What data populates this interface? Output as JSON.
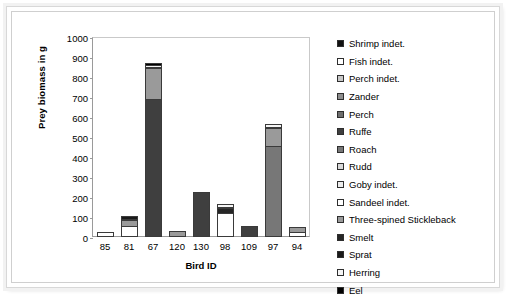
{
  "chart_data": {
    "type": "bar",
    "subtype": "stacked-bar",
    "title": "",
    "xlabel": "Bird ID",
    "ylabel": "Prey biomass in g",
    "categories": [
      "85",
      "81",
      "67",
      "120",
      "130",
      "98",
      "109",
      "97",
      "94"
    ],
    "ylim": [
      0,
      1000
    ],
    "yticks": [
      0,
      100,
      200,
      300,
      400,
      500,
      600,
      700,
      800,
      900,
      1000
    ],
    "grid": false,
    "legend_position": "right",
    "series": [
      {
        "name": "Shrimp indet.",
        "color": "#111111",
        "values": [
          0,
          0,
          0,
          0,
          0,
          0,
          0,
          0,
          0
        ]
      },
      {
        "name": "Fish indet.",
        "color": "#ffffff",
        "values": [
          25,
          55,
          0,
          0,
          0,
          0,
          0,
          0,
          22
        ]
      },
      {
        "name": "Perch indet.",
        "color": "#c8c8c8",
        "values": [
          0,
          0,
          0,
          0,
          0,
          0,
          0,
          0,
          0
        ]
      },
      {
        "name": "Zander",
        "color": "#8e8e8e",
        "values": [
          0,
          0,
          0,
          0,
          0,
          0,
          0,
          0,
          0
        ]
      },
      {
        "name": "Perch",
        "color": "#6e6e6e",
        "values": [
          0,
          0,
          0,
          0,
          0,
          0,
          0,
          0,
          0
        ]
      },
      {
        "name": "Ruffe",
        "color": "#3f3f3f",
        "values": [
          0,
          0,
          690,
          0,
          222,
          0,
          55,
          0,
          0
        ]
      },
      {
        "name": "Roach",
        "color": "#777777",
        "values": [
          0,
          0,
          0,
          0,
          0,
          0,
          0,
          455,
          0
        ]
      },
      {
        "name": "Rudd",
        "color": "#d9d9d9",
        "values": [
          0,
          0,
          0,
          0,
          0,
          0,
          0,
          0,
          0
        ]
      },
      {
        "name": "Goby indet.",
        "color": "#ededed",
        "values": [
          0,
          0,
          0,
          0,
          0,
          0,
          0,
          0,
          0
        ]
      },
      {
        "name": "Sandeel indet.",
        "color": "#ffffff",
        "values": [
          0,
          0,
          0,
          0,
          0,
          118,
          0,
          0,
          0
        ]
      },
      {
        "name": "Three-spined Stickleback",
        "color": "#9a9a9a",
        "values": [
          0,
          35,
          160,
          30,
          0,
          0,
          0,
          95,
          30
        ]
      },
      {
        "name": "Smelt",
        "color": "#262626",
        "values": [
          0,
          0,
          0,
          0,
          0,
          32,
          0,
          0,
          0
        ]
      },
      {
        "name": "Sprat",
        "color": "#1a1a1a",
        "values": [
          0,
          22,
          0,
          0,
          0,
          0,
          0,
          0,
          0
        ]
      },
      {
        "name": "Herring",
        "color": "#f5f5f5",
        "values": [
          0,
          0,
          18,
          0,
          0,
          20,
          0,
          20,
          0
        ]
      },
      {
        "name": "Eel",
        "color": "#000000",
        "values": [
          0,
          0,
          12,
          0,
          0,
          0,
          0,
          0,
          0
        ]
      }
    ],
    "totals": [
      25,
      112,
      880,
      30,
      222,
      170,
      55,
      570,
      52
    ]
  },
  "legend": {
    "items": [
      {
        "label": "Shrimp indet.",
        "color": "#111111"
      },
      {
        "label": "Fish indet.",
        "color": "#ffffff"
      },
      {
        "label": "Perch indet.",
        "color": "#c8c8c8"
      },
      {
        "label": "Zander",
        "color": "#8e8e8e"
      },
      {
        "label": "Perch",
        "color": "#6e6e6e"
      },
      {
        "label": "Ruffe",
        "color": "#3f3f3f"
      },
      {
        "label": "Roach",
        "color": "#777777"
      },
      {
        "label": "Rudd",
        "color": "#d9d9d9"
      },
      {
        "label": "Goby indet.",
        "color": "#ededed"
      },
      {
        "label": "Sandeel indet.",
        "color": "#ffffff"
      },
      {
        "label": "Three-spined Stickleback",
        "color": "#9a9a9a"
      },
      {
        "label": "Smelt",
        "color": "#262626"
      },
      {
        "label": "Sprat",
        "color": "#1a1a1a"
      },
      {
        "label": "Herring",
        "color": "#f5f5f5"
      },
      {
        "label": "Eel",
        "color": "#000000"
      }
    ]
  }
}
